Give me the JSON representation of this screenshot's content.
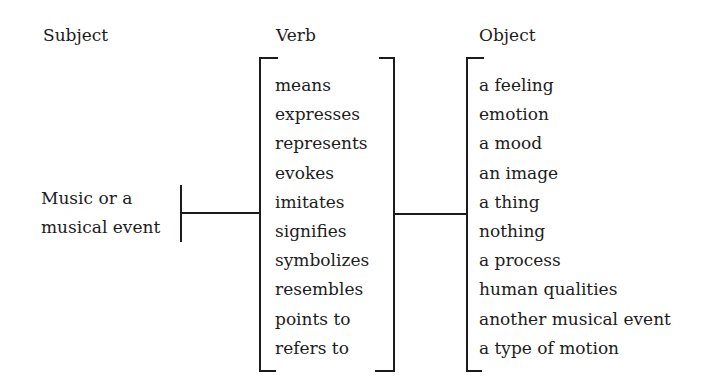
{
  "headers": {
    "subject": "Subject",
    "verb": "Verb",
    "object": "Object"
  },
  "subject": {
    "line1": "Music or a",
    "line2": "musical event"
  },
  "verbs": [
    "means",
    "expresses",
    "represents",
    "evokes",
    "imitates",
    "signifies",
    "symbolizes",
    "resembles",
    "points to",
    "refers to"
  ],
  "objects": [
    "a feeling",
    "emotion",
    "a mood",
    "an image",
    "a thing",
    "nothing",
    "a process",
    "human qualities",
    "another musical event",
    "a type of motion"
  ]
}
